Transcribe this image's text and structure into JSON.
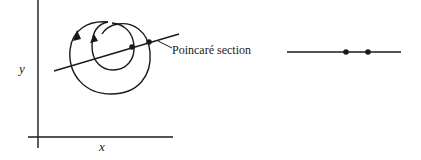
{
  "diagram": {
    "left_panel": {
      "axis_x_label": "x",
      "axis_y_label": "y",
      "section_label": "Poincaré section",
      "trajectory": "spiral orbit with two loops and direction arrows",
      "intersection_points": 2
    },
    "right_panel": {
      "description": "Poincaré section line with two intersection points",
      "points": 2
    },
    "colors": {
      "stroke": "#1a1a1a",
      "background": "#ffffff"
    }
  }
}
